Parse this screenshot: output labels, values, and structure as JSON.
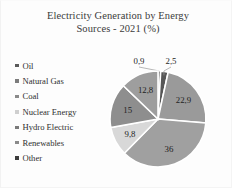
{
  "chart_data": {
    "type": "pie",
    "title": "Electricity Generation by Energy Sources - 2021 (%)",
    "title_line1": "Electricity Generation by Energy",
    "title_line2": "Sources - 2021 (%)",
    "xlabel": "",
    "ylabel": "",
    "units": "%",
    "decimal_separator": ",",
    "legend_position": "left",
    "grid": false,
    "categories": [
      "Oil",
      "Natural Gas",
      "Coal",
      "Nuclear Energy",
      "Hydro Electric",
      "Renewables",
      "Other"
    ],
    "values": [
      0.9,
      2.5,
      22.9,
      36,
      9.8,
      15,
      12.8
    ],
    "labels": [
      "0,9",
      "2,5",
      "22,9",
      "36",
      "9,8",
      "15",
      "12,8"
    ],
    "colors": [
      "#4a4a4a",
      "#565656",
      "#9a9a9a",
      "#a0a0a0",
      "#d8d8d8",
      "#8e8e8e",
      "#9e9e9e"
    ],
    "slices": [
      {
        "name": "Oil",
        "value": 0.9,
        "label": "0,9",
        "color": "#4a4a4a",
        "callout": true
      },
      {
        "name": "Natural Gas",
        "value": 2.5,
        "label": "2,5",
        "color": "#565656",
        "callout": true
      },
      {
        "name": "Coal",
        "value": 22.9,
        "label": "22,9",
        "color": "#9a9a9a",
        "callout": false
      },
      {
        "name": "Nuclear Energy",
        "value": 36,
        "label": "36",
        "color": "#a0a0a0",
        "callout": false
      },
      {
        "name": "Hydro Electric",
        "value": 9.8,
        "label": "9,8",
        "color": "#d8d8d8",
        "callout": false
      },
      {
        "name": "Renewables",
        "value": 15,
        "label": "15",
        "color": "#8e8e8e",
        "callout": false
      },
      {
        "name": "Other",
        "value": 12.8,
        "label": "12,8",
        "color": "#9e9e9e",
        "callout": false
      }
    ]
  },
  "legend": {
    "items": [
      {
        "label": "Oil",
        "color": "#5a5a5a"
      },
      {
        "label": "Natural Gas",
        "color": "#7c7c7c"
      },
      {
        "label": "Coal",
        "color": "#8a8a8a"
      },
      {
        "label": "Nuclear Energy",
        "color": "#cfcfcf"
      },
      {
        "label": "Hydro Electric",
        "color": "#7a7a7a"
      },
      {
        "label": "Renewables",
        "color": "#8a8a8a"
      },
      {
        "label": "Other",
        "color": "#3c3c3c"
      }
    ]
  }
}
